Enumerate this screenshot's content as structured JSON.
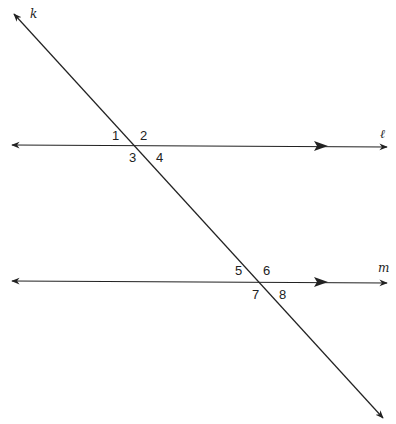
{
  "diagram": {
    "lines": {
      "transversal": {
        "label": "k"
      },
      "parallel_top": {
        "label": "ℓ"
      },
      "parallel_bottom": {
        "label": "m"
      }
    },
    "angles_top": [
      "1",
      "2",
      "3",
      "4"
    ],
    "angles_bottom": [
      "5",
      "6",
      "7",
      "8"
    ],
    "colors": {
      "stroke": "#222222",
      "background": "#ffffff"
    }
  }
}
